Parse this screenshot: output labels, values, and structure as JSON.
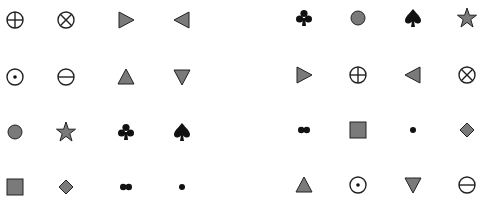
{
  "colors": {
    "stroke": "#222222",
    "fill_gray": "#7a7a7a",
    "fill_black": "#111111"
  },
  "left_grid": {
    "columns_x": [
      15,
      66,
      126,
      182
    ],
    "rows_y": [
      20,
      77,
      132,
      187
    ],
    "rows": [
      [
        "circle-plus",
        "circle-times",
        "triangle-right",
        "triangle-left"
      ],
      [
        "circle-dot",
        "circle-minus",
        "triangle-up",
        "triangle-down"
      ],
      [
        "circle-filled",
        "star",
        "club",
        "spade"
      ],
      [
        "square",
        "diamond",
        "double-dot",
        "small-dot"
      ]
    ]
  },
  "right_grid": {
    "columns_x": [
      304,
      358,
      413,
      467
    ],
    "rows_y": [
      18,
      75,
      130,
      185
    ],
    "rows": [
      [
        "club",
        "circle-filled",
        "spade",
        "star"
      ],
      [
        "triangle-right",
        "circle-plus",
        "triangle-left",
        "circle-times"
      ],
      [
        "double-dot",
        "square",
        "small-dot",
        "diamond"
      ],
      [
        "triangle-up",
        "circle-dot",
        "triangle-down",
        "circle-minus"
      ]
    ]
  }
}
